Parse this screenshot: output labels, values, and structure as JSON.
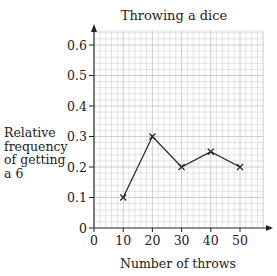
{
  "chart_data": {
    "type": "line",
    "title": "Throwing a dice",
    "xlabel": "Number of throws",
    "ylabel_lines": [
      "Relative",
      "frequency",
      "of getting",
      "a 6"
    ],
    "x": [
      10,
      20,
      30,
      40,
      50
    ],
    "values": [
      0.1,
      0.3,
      0.2,
      0.25,
      0.2
    ],
    "x_ticks": [
      "0",
      "10",
      "20",
      "30",
      "40",
      "50"
    ],
    "y_ticks": [
      "0",
      "0.1",
      "0.2",
      "0.3",
      "0.4",
      "0.5",
      "0.6"
    ],
    "xlim": [
      0,
      58
    ],
    "ylim": [
      0,
      0.64
    ],
    "grid": true,
    "marker": "x",
    "colors": {
      "line": "#222222",
      "grid": "#c8c8c8",
      "axis": "#222222"
    }
  }
}
